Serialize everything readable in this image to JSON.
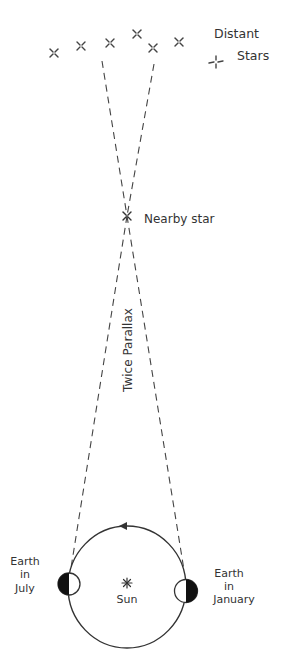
{
  "diagram": {
    "labels": {
      "distant_stars_line1": "Distant",
      "distant_stars_line2": "Stars",
      "nearby_star": "Nearby star",
      "twice_parallax": "Twice Parallax",
      "earth_july_line1": "Earth",
      "earth_july_line2": "in",
      "earth_july_line3": "July",
      "earth_january_line1": "Earth",
      "earth_january_line2": "in",
      "earth_january_line3": "January",
      "sun": "Sun"
    },
    "colors": {
      "ink": "#333333",
      "background": "#ffffff",
      "earth_shadow": "#111111"
    }
  }
}
